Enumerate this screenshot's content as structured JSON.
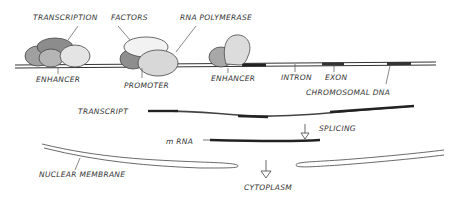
{
  "labels": {
    "transcription": "TRANSCRIPTION",
    "factors": "FACTORS",
    "rna_polymerase": "RNA POLYMERASE",
    "enhancer_left": "ENHANCER",
    "promoter": "PROMOTER",
    "enhancer_right": "ENHANCER",
    "intron": "INTRON",
    "exon": "EXON",
    "chromosomal_dna": "CHROMOSOMAL DNA",
    "transcript": "TRANSCRIPT",
    "splicing": "SPLICING",
    "mrna": "m RNA",
    "nuclear_membrane": "NUCLEAR MEMBRANE",
    "cytoplasm": "CYTOPLASM"
  },
  "colors": {
    "line": "#333333",
    "dark_protein": "#8a8a8a",
    "mid_protein": "#a9a9a9",
    "light_protein": "#dcdcdc",
    "exon": "#222222"
  }
}
